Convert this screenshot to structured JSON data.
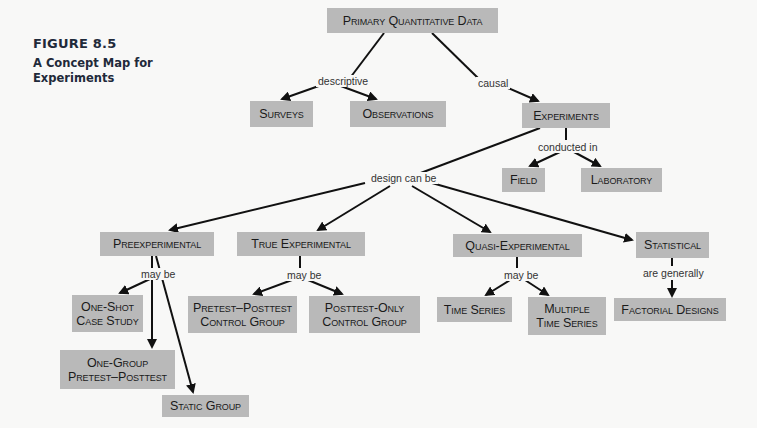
{
  "figure": {
    "number": "FIGURE 8.5",
    "title": "A Concept Map for Experiments"
  },
  "colors": {
    "node_fill": "#b9b9b9",
    "edge": "#111111",
    "background": "#f8f8f7",
    "caption": "#1f2a3a"
  },
  "nodes": {
    "primary": "Primary Quantitative Data",
    "surveys": "Surveys",
    "observations": "Observations",
    "experiments": "Experiments",
    "field": "Field",
    "laboratory": "Laboratory",
    "preexperimental": "Preexperimental",
    "true_experimental": "True Experimental",
    "quasi_experimental": "Quasi-Experimental",
    "statistical": "Statistical",
    "one_shot": "One-Shot Case Study",
    "one_group": "One-Group Pretest–Posttest",
    "static_group": "Static Group",
    "pretest_posttest_cg": "Pretest–Posttest Control Group",
    "posttest_only_cg": "Posttest-Only Control Group",
    "time_series": "Time Series",
    "multiple_time_series": "Multiple Time Series",
    "factorial_designs": "Factorial Designs"
  },
  "links": {
    "descriptive": "descriptive",
    "causal": "causal",
    "conducted_in": "conducted in",
    "design_can_be": "design can be",
    "may_be_pre": "may be",
    "may_be_true": "may be",
    "may_be_quasi": "may be",
    "are_generally": "are generally"
  }
}
